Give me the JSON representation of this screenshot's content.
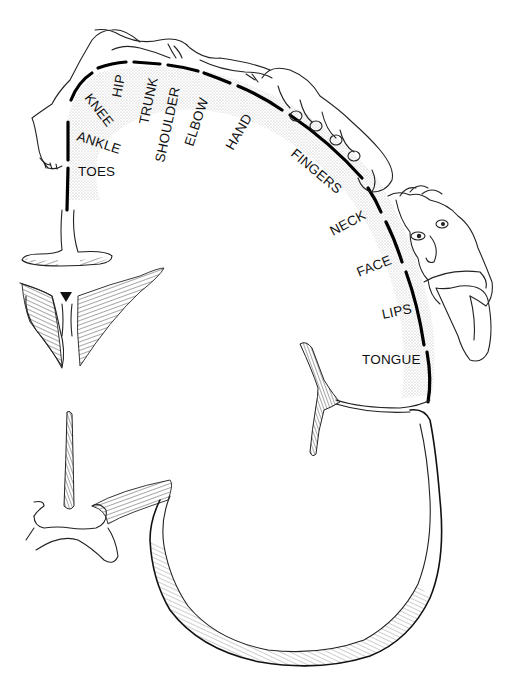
{
  "figure": {
    "type": "motor homunculus (cortical cross-section)",
    "labels": [
      {
        "id": "toes",
        "text": "TOES"
      },
      {
        "id": "ankle",
        "text": "ANKLE"
      },
      {
        "id": "knee",
        "text": "KNEE"
      },
      {
        "id": "hip",
        "text": "HIP"
      },
      {
        "id": "trunk",
        "text": "TRUNK"
      },
      {
        "id": "shoulder",
        "text": "SHOULDER"
      },
      {
        "id": "elbow",
        "text": "ELBOW"
      },
      {
        "id": "hand",
        "text": "HAND"
      },
      {
        "id": "fingers",
        "text": "FINGERS"
      },
      {
        "id": "neck",
        "text": "NECK"
      },
      {
        "id": "face",
        "text": "FACE"
      },
      {
        "id": "lips",
        "text": "LIPS"
      },
      {
        "id": "tongue",
        "text": "TONGUE"
      }
    ],
    "colors": {
      "line": "#111111",
      "stipple": "#bdbdbd",
      "background": "#ffffff"
    }
  }
}
